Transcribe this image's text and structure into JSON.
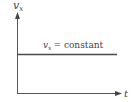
{
  "diagram": {
    "y_axis_label": "v",
    "y_axis_label_sub": "x",
    "x_axis_label": "t",
    "line_label_var": "v",
    "line_label_sub": "x",
    "line_label_rest": "=  constant",
    "colors": {
      "axis": "#555555",
      "line": "#4a4a4a",
      "text": "#444444"
    }
  }
}
